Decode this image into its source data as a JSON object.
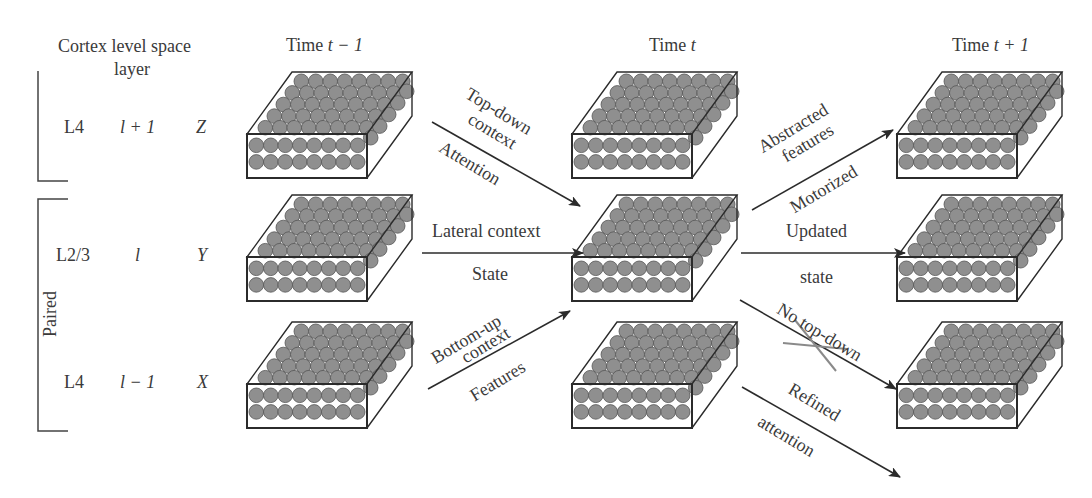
{
  "header": {
    "left_title_line1": "Cortex level space",
    "left_title_line2": "layer",
    "time_prev": "Time t − 1",
    "time_prev_prefix": "Time ",
    "time_prev_var": "t − 1",
    "time_now_prefix": "Time ",
    "time_now_var": "t",
    "time_next_prefix": "Time ",
    "time_next_var": "t + 1"
  },
  "rows": [
    {
      "cortex": "L4",
      "level": "l + 1",
      "space": "Z"
    },
    {
      "cortex": "L2/3",
      "level": "l",
      "space": "Y"
    },
    {
      "cortex": "L4",
      "level": "l − 1",
      "space": "X"
    }
  ],
  "bracket_label": "Paired",
  "arrows": {
    "top_down": {
      "line1": "Top-down",
      "line2": "context",
      "below": "Attention"
    },
    "lateral": {
      "above": "Lateral context",
      "below": "State"
    },
    "bottom_up": {
      "line1": "Bottom-up",
      "line2": "context",
      "below": "Features"
    },
    "abstracted": {
      "line1": "Abstracted",
      "line2": "features",
      "below": "Motorized"
    },
    "updated": {
      "above": "Updated",
      "below": "state"
    },
    "no_top_down": {
      "label": "No top-down"
    },
    "refined": {
      "line1": "Refined",
      "line2": "attention"
    }
  },
  "colors": {
    "sphere_fill": "#8f8f8f",
    "sphere_stroke": "#555555",
    "line": "#2b2b2b",
    "cross": "#8a8a8a"
  }
}
